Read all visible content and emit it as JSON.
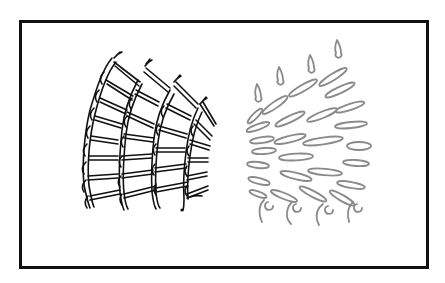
{
  "figure": {
    "colors": {
      "background": "#ffffff",
      "frame": "#111111",
      "left_ink": "#111111",
      "right_ink": "#8a8a8a"
    },
    "frame": {
      "x": 19,
      "y": 20,
      "width": 407,
      "height": 246,
      "stroke_width": 3
    },
    "left_panel": {
      "columns": 4,
      "rungs_per_column": [
        9,
        8,
        7,
        7
      ]
    },
    "right_panel": {
      "teardrops": 4,
      "oval_rows": 8,
      "hooks": 4
    }
  }
}
